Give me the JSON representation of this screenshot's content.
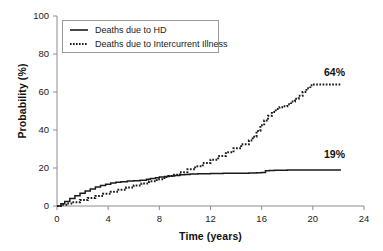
{
  "chart_data": {
    "type": "line",
    "title": "",
    "subtitle": "",
    "xlabel": "Time (years)",
    "ylabel": "Probability (%)",
    "xlim": [
      0,
      24
    ],
    "ylim": [
      0,
      100
    ],
    "xticks": [
      0,
      4,
      8,
      12,
      16,
      20,
      24
    ],
    "yticks": [
      0,
      20,
      40,
      60,
      80,
      100
    ],
    "grid": false,
    "legend_position": "top-left",
    "series": [
      {
        "name": "Deaths due to HD",
        "style": "solid",
        "color": "#1a1a1a",
        "end_label": "19%",
        "x": [
          0,
          0.3,
          0.6,
          1.0,
          1.4,
          1.8,
          2.2,
          2.6,
          3.0,
          3.4,
          3.8,
          4.2,
          4.6,
          5.0,
          5.5,
          6.0,
          6.5,
          7.0,
          7.3,
          7.7,
          8.0,
          8.4,
          8.8,
          9.2,
          9.6,
          10.0,
          10.4,
          11.0,
          12.0,
          13.0,
          14.0,
          15.0,
          15.6,
          16.0,
          16.3,
          16.6,
          17.0,
          18.0,
          19.0,
          20.0,
          21.0,
          22.0,
          22.2
        ],
        "y": [
          0,
          1.2,
          2.4,
          4.0,
          5.4,
          6.7,
          7.9,
          9.0,
          10.0,
          10.8,
          11.5,
          12.1,
          12.5,
          12.8,
          13.1,
          13.3,
          13.6,
          14.1,
          14.5,
          14.9,
          15.2,
          15.5,
          15.8,
          16.1,
          16.4,
          16.6,
          16.8,
          17.0,
          17.1,
          17.2,
          17.3,
          17.4,
          17.5,
          17.6,
          18.6,
          18.7,
          18.8,
          18.9,
          18.9,
          18.9,
          18.9,
          18.9,
          18.9
        ]
      },
      {
        "name": "Deaths due to Intercurrent Illness",
        "style": "dotted",
        "color": "#1a1a1a",
        "end_label": "64%",
        "x": [
          0,
          0.4,
          0.8,
          1.2,
          1.8,
          2.4,
          3.0,
          3.6,
          4.2,
          4.8,
          5.4,
          6.0,
          6.6,
          7.2,
          7.8,
          8.4,
          8.7,
          9.0,
          9.6,
          10.2,
          10.8,
          11.4,
          12.0,
          12.6,
          13.2,
          13.8,
          14.4,
          15.0,
          15.3,
          15.6,
          15.9,
          16.2,
          16.5,
          16.8,
          17.1,
          17.4,
          17.7,
          18.0,
          18.3,
          18.6,
          18.9,
          19.2,
          19.5,
          19.8,
          20.0,
          20.5,
          21.0,
          21.5,
          22.0,
          22.2
        ],
        "y": [
          0,
          0.6,
          1.3,
          2.0,
          3.1,
          4.2,
          5.3,
          6.4,
          7.5,
          8.6,
          9.7,
          10.8,
          11.9,
          13.0,
          14.1,
          15.2,
          15.8,
          16.4,
          17.8,
          19.3,
          20.9,
          22.6,
          24.4,
          26.3,
          28.3,
          30.4,
          32.5,
          34.5,
          36.5,
          39.5,
          42.5,
          45.0,
          47.5,
          49.5,
          51.0,
          52.0,
          52.5,
          53.5,
          55.0,
          56.5,
          58.0,
          60.0,
          62.0,
          63.5,
          64.0,
          64.0,
          64.0,
          64.0,
          64.0,
          64.0
        ]
      }
    ],
    "annotations": [
      {
        "text": "64%",
        "x": 20.5,
        "y": 68
      },
      {
        "text": "19%",
        "x": 20.5,
        "y": 24
      }
    ]
  },
  "axes": {
    "y_tick_labels": [
      "100",
      "80",
      "60",
      "40",
      "20",
      "0"
    ],
    "x_tick_labels": [
      "0",
      "4",
      "8",
      "12",
      "16",
      "20",
      "24"
    ],
    "y_title": "Probability (%)",
    "x_title": "Time (years)"
  },
  "legend": {
    "entries": [
      {
        "label": "Deaths due to HD",
        "style": "solid"
      },
      {
        "label": "Deaths due to Intercurrent Illness",
        "style": "dotted"
      }
    ]
  },
  "annotations": {
    "upper": "64%",
    "lower": "19%"
  },
  "colors": {
    "line": "#1a1a1a",
    "axis": "#8c8c8c",
    "text": "#111111",
    "background": "#ffffff"
  }
}
